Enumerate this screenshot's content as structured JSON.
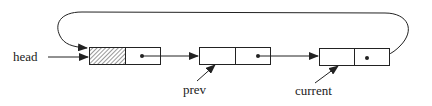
{
  "diagram": {
    "type": "circular-linked-list",
    "labels": {
      "head": "head",
      "prev": "prev",
      "current": "current"
    },
    "nodes": [
      {
        "id": "node-1",
        "data_cell": "hatched",
        "role": "header node"
      },
      {
        "id": "node-2",
        "data_cell": "empty",
        "role": "prev"
      },
      {
        "id": "node-3",
        "data_cell": "empty",
        "role": "current"
      }
    ],
    "links": [
      {
        "from": "head",
        "to": "node-1"
      },
      {
        "from": "node-1",
        "to": "node-2"
      },
      {
        "from": "node-2",
        "to": "node-3"
      },
      {
        "from": "node-3",
        "to": "node-1",
        "kind": "loop-back"
      },
      {
        "from": "prev",
        "to": "node-2"
      },
      {
        "from": "current",
        "to": "node-3"
      }
    ]
  }
}
